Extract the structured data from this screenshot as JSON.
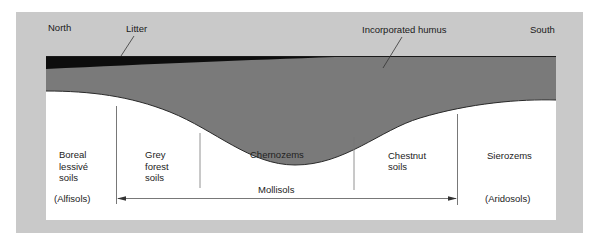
{
  "diagram": {
    "orientation": {
      "left_label": "North",
      "right_label": "South"
    },
    "layers": {
      "litter_label": "Litter",
      "humus_label": "Incorporated humus"
    },
    "soil_zones": [
      {
        "name_lines": [
          "Boreal",
          "lessivé",
          "soils"
        ],
        "order": "(Alfisols)"
      },
      {
        "name_lines": [
          "Grey",
          "forest",
          "soils"
        ],
        "order": ""
      },
      {
        "name_lines": [
          "Chernozems"
        ],
        "order": ""
      },
      {
        "name_lines": [
          "Chestnut",
          "soils"
        ],
        "order": ""
      },
      {
        "name_lines": [
          "Sierozems"
        ],
        "order": "(Aridosols)"
      }
    ],
    "span": {
      "label": "Mollisols",
      "from_zone": "Grey forest soils",
      "to_zone": "Chestnut soils"
    },
    "colors": {
      "frame": "#c9c9c9",
      "humus": "#7a7a7a",
      "litter": "#0d0d0d",
      "background": "#ffffff",
      "line": "#555555"
    }
  }
}
